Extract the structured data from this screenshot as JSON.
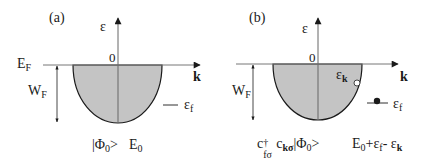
{
  "panels": [
    {
      "id": "a",
      "tag": "(a)",
      "y_axis_label": "ε",
      "origin_label": "0",
      "x_axis_label": "k",
      "fermi_label": "E",
      "fermi_sub": "F",
      "bandwidth_label": "W",
      "bandwidth_sub": "F",
      "f_level_label": "ε",
      "f_level_sub": "f",
      "state_ket": "|Φ",
      "state_ket_sub": "0",
      "state_ket_close": ">",
      "energy": "E",
      "energy_sub": "0"
    },
    {
      "id": "b",
      "tag": "(b)",
      "y_axis_label": "ε",
      "origin_label": "0",
      "x_axis_label": "k",
      "bandwidth_label": "W",
      "bandwidth_sub": "F",
      "hole_label": "ε",
      "hole_sub": "k",
      "f_level_label": "ε",
      "f_level_sub": "f",
      "state_op1": "c",
      "state_op1_sup": "†",
      "state_op1_sub": "fσ",
      "state_op2": "c",
      "state_op2_sub": "kσ",
      "state_ket": "|Φ",
      "state_ket_sub": "0",
      "state_ket_close": ">",
      "energy_E": "E",
      "energy_E_sub": "0",
      "energy_plus": "+ε",
      "energy_f_sub": "f",
      "energy_minus": "- ε",
      "energy_k_sub": "k"
    }
  ],
  "colors": {
    "band_fill": "#c4c4c4",
    "line": "#1a1a1a",
    "axis": "#555555"
  }
}
